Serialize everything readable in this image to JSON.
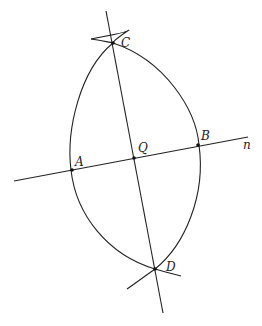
{
  "diagram": {
    "type": "geometric-construction",
    "stroke_color": "#222222",
    "labels": {
      "C": "C",
      "Q": "Q",
      "B": "B",
      "A": "A",
      "D": "D",
      "n": "n"
    },
    "points": {
      "A": [
        72,
        170
      ],
      "Q": [
        134,
        158
      ],
      "B": [
        198,
        145
      ],
      "C": [
        113,
        43
      ],
      "D": [
        155,
        269
      ]
    },
    "lines": [
      {
        "name": "line-n",
        "from": [
          14,
          181
        ],
        "to": [
          248,
          137
        ]
      },
      {
        "name": "line-CD",
        "from": [
          106,
          11
        ],
        "to": [
          163,
          313
        ]
      }
    ]
  }
}
